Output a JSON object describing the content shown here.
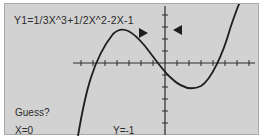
{
  "screen": {
    "background": "#d2d2d2",
    "equation": "Y1=1/3X^3+1/2X^2-2X-1",
    "prompt": "Guess?",
    "cursor_x": "X=0",
    "cursor_y": "Y=-1"
  },
  "graph": {
    "function": "1/3x^3+1/2x^2-2x-1",
    "markers": [
      {
        "name": "right-pointing-marker",
        "direction": "right"
      },
      {
        "name": "left-pointing-marker",
        "direction": "left"
      }
    ],
    "curve_color": "#1e1e1e",
    "axis_color": "#2a2a2a"
  }
}
